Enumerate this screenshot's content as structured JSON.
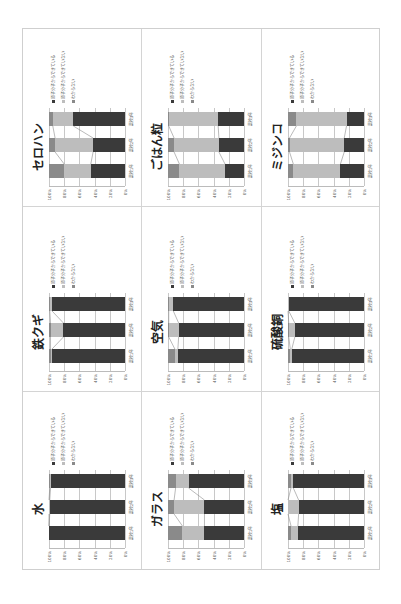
{
  "colors": {
    "yes": "#3a3a3a",
    "no": "#bdbdbd",
    "unknown": "#8a8a8a",
    "grid": "#c8c8c8"
  },
  "legend": [
    {
      "key": "yes",
      "label": "原子分子からできている"
    },
    {
      "key": "no",
      "label": "原子分子からできていない"
    },
    {
      "key": "unknown",
      "label": "わからない"
    }
  ],
  "y_ticks": [
    "100%",
    "80%",
    "60%",
    "40%",
    "20%",
    "0%"
  ],
  "categories": [
    "高校1年",
    "高校2年",
    "高校3年"
  ],
  "chart_data": [
    {
      "type": "bar",
      "stacked": "percent",
      "title": "セロハン",
      "categories": [
        "高校1年",
        "高校2年",
        "高校3年"
      ],
      "series": [
        {
          "name": "原子分子からできている",
          "values": [
            45,
            42,
            68
          ]
        },
        {
          "name": "原子分子からできていない",
          "values": [
            35,
            50,
            27
          ]
        },
        {
          "name": "わからない",
          "values": [
            20,
            8,
            5
          ]
        }
      ],
      "ylim": [
        0,
        100
      ]
    },
    {
      "type": "bar",
      "stacked": "percent",
      "title": "ごはん粒",
      "categories": [
        "高校1年",
        "高校2年",
        "高校3年"
      ],
      "series": [
        {
          "name": "原子分子からできている",
          "values": [
            25,
            33,
            34
          ]
        },
        {
          "name": "原子分子からできていない",
          "values": [
            60,
            59,
            65
          ]
        },
        {
          "name": "わからない",
          "values": [
            15,
            8,
            1
          ]
        }
      ],
      "ylim": [
        0,
        100
      ]
    },
    {
      "type": "bar",
      "stacked": "percent",
      "title": "ミジンコ",
      "categories": [
        "高校1年",
        "高校2年",
        "高校3年"
      ],
      "series": [
        {
          "name": "原子分子からできている",
          "values": [
            31,
            26,
            23
          ]
        },
        {
          "name": "原子分子からできていない",
          "values": [
            62,
            72,
            66
          ]
        },
        {
          "name": "わからない",
          "values": [
            7,
            2,
            11
          ]
        }
      ],
      "ylim": [
        0,
        100
      ]
    },
    {
      "type": "bar",
      "stacked": "percent",
      "title": "鉄クギ",
      "categories": [
        "高校1年",
        "高校2年",
        "高校3年"
      ],
      "series": [
        {
          "name": "原子分子からできている",
          "values": [
            96,
            81,
            96
          ]
        },
        {
          "name": "原子分子からできていない",
          "values": [
            2,
            17,
            3
          ]
        },
        {
          "name": "わからない",
          "values": [
            2,
            2,
            1
          ]
        }
      ],
      "ylim": [
        0,
        100
      ]
    },
    {
      "type": "bar",
      "stacked": "percent",
      "title": "空気",
      "categories": [
        "高校1年",
        "高校2年",
        "高校3年"
      ],
      "series": [
        {
          "name": "原子分子からできている",
          "values": [
            87,
            86,
            93
          ]
        },
        {
          "name": "原子分子からできていない",
          "values": [
            4,
            13,
            6
          ]
        },
        {
          "name": "わからない",
          "values": [
            9,
            1,
            1
          ]
        }
      ],
      "ylim": [
        0,
        100
      ]
    },
    {
      "type": "bar",
      "stacked": "percent",
      "title": "硫酸銅",
      "categories": [
        "高校1年",
        "高校2年",
        "高校3年"
      ],
      "series": [
        {
          "name": "原子分子からできている",
          "values": [
            95,
            91,
            99
          ]
        },
        {
          "name": "原子分子からできていない",
          "values": [
            2,
            8,
            1
          ]
        },
        {
          "name": "わからない",
          "values": [
            3,
            1,
            0
          ]
        }
      ],
      "ylim": [
        0,
        100
      ]
    },
    {
      "type": "bar",
      "stacked": "percent",
      "title": "水",
      "categories": [
        "高校1年",
        "高校2年",
        "高校3年"
      ],
      "series": [
        {
          "name": "原子分子からできている",
          "values": [
            100,
            99,
            98
          ]
        },
        {
          "name": "原子分子からできていない",
          "values": [
            0,
            1,
            1
          ]
        },
        {
          "name": "わからない",
          "values": [
            0,
            0,
            1
          ]
        }
      ],
      "ylim": [
        0,
        100
      ]
    },
    {
      "type": "bar",
      "stacked": "percent",
      "title": "ガラス",
      "categories": [
        "高校1年",
        "高校2年",
        "高校3年"
      ],
      "series": [
        {
          "name": "原子分子からできている",
          "values": [
            52,
            52,
            73
          ]
        },
        {
          "name": "原子分子からできていない",
          "values": [
            29,
            40,
            17
          ]
        },
        {
          "name": "わからない",
          "values": [
            19,
            8,
            10
          ]
        }
      ],
      "ylim": [
        0,
        100
      ]
    },
    {
      "type": "bar",
      "stacked": "percent",
      "title": "塩",
      "categories": [
        "高校1年",
        "高校2年",
        "高校3年"
      ],
      "series": [
        {
          "name": "原子分子からできている",
          "values": [
            87,
            86,
            93
          ]
        },
        {
          "name": "原子分子からできていない",
          "values": [
            9,
            14,
            3
          ]
        },
        {
          "name": "わからない",
          "values": [
            4,
            0,
            4
          ]
        }
      ],
      "ylim": [
        0,
        100
      ]
    }
  ]
}
